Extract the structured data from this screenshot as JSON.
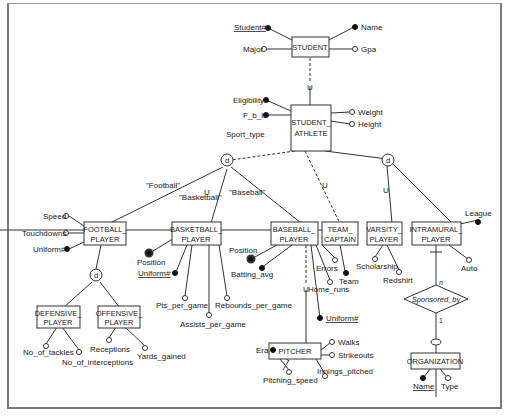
{
  "diagram": {
    "type": "EER diagram",
    "entities": {
      "student": "STUDENT",
      "student_athlete_1": "STUDENT_",
      "student_athlete_2": "ATHLETE",
      "football_1": "FOOTBALL_",
      "football_2": "PLAYER",
      "basketball_1": "BASKETBALL_",
      "basketball_2": "PLAYER",
      "baseball_1": "BASEBALL_",
      "baseball_2": "PLAYER",
      "team_captain_1": "TEAM_",
      "team_captain_2": "CAPTAIN",
      "varsity_1": "VARSITY_",
      "varsity_2": "PLAYER",
      "intramural_1": "INTRAMURAL_",
      "intramural_2": "PLAYER",
      "defensive_1": "DEFENSIVE_",
      "defensive_2": "PLAYER",
      "offensive_1": "OFFENSIVE_",
      "offensive_2": "PLAYER",
      "pitcher": "PITCHER",
      "organization": "ORGANIZATION"
    },
    "relationship": {
      "name": "Sponsored_by",
      "card_top": "n",
      "card_bottom": "1"
    },
    "attributes": {
      "student_no": "Student#",
      "name": "Name",
      "major": "Major",
      "gpa": "Gpa",
      "eligibility": "Eligibility",
      "fbb": "F_b_b",
      "weight": "Weight",
      "height": "Height",
      "sport_type": "Sport_type",
      "speed": "Speed",
      "touchdowns": "Touchdowns",
      "uniform_fb": "Uniform#",
      "position_bk": "Position",
      "uniform_bk": "Uniform#",
      "pts": "Pts_per_game",
      "assists": "Assists_per_game",
      "rebounds": "Rebounds_per_game",
      "position_bs": "Position",
      "batting": "Batting_avg",
      "errors": "Errors",
      "home_runs": "Home_runs",
      "uniform_bs": "Uniform#",
      "team": "Team",
      "scholarship": "Scholarship",
      "redshirt": "Redshirt",
      "league": "League",
      "auto": "Auto",
      "tackles": "No_of_tackles",
      "interceptions": "No_of_interceptions",
      "receptions": "Receptions",
      "yards": "Yards_gained",
      "era": "Era",
      "walks": "Walks",
      "strikeouts": "Strikeouts",
      "pitching_speed": "Pitching_speed",
      "innings": "Innings_pitched",
      "org_name": "Name",
      "org_type": "Type"
    },
    "labels": {
      "football": "\"Football\"",
      "basketball": "\"Basketball\"",
      "baseball": "\"Baseball\"",
      "disjoint": "d",
      "subset": "U"
    }
  }
}
